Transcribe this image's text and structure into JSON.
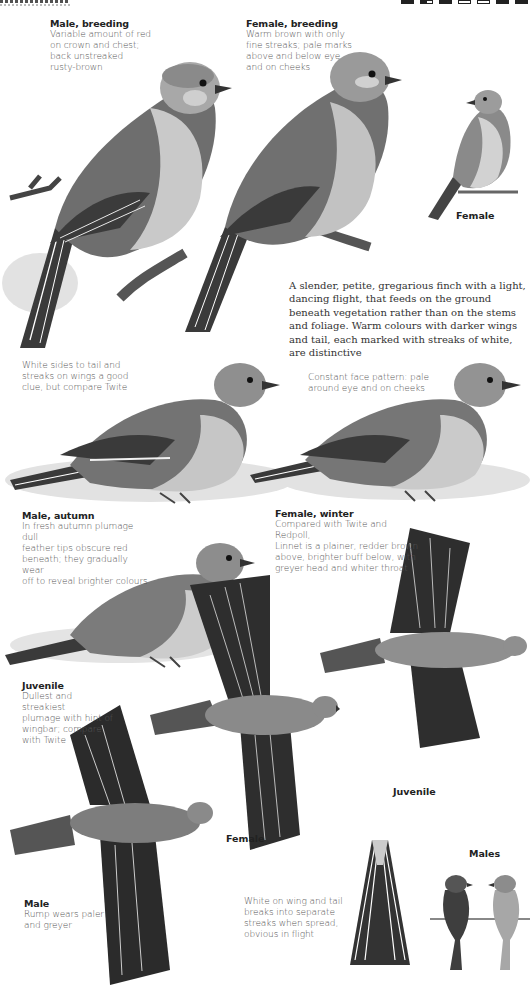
{
  "running_head": {
    "icons": [
      "habitat-icon",
      "size-icon",
      "flight-icon",
      "plumage-icon",
      "song-icon",
      "range-icon",
      "season-icon"
    ]
  },
  "captions": {
    "male_breeding": {
      "title": "Male, breeding",
      "body": "Variable amount of red\non crown and chest;\nback unstreaked\nrusty-brown"
    },
    "female_breeding": {
      "title": "Female, breeding",
      "body": "Warm brown with only\nfine streaks; pale marks\nabove and below eye\nand on cheeks"
    },
    "female_perched_label": "Female",
    "intro": "A slender, petite, gregarious finch with a light, dancing flight, that feeds on the ground beneath vegetation rather than on the stems and foliage. Warm colours with darker wings and tail, each marked with streaks of white, are distinctive",
    "white_sides": {
      "body": "White sides to tail and\nstreaks on wings a good\nclue, but compare Twite"
    },
    "face_pattern": {
      "body": "Constant face pattern: pale\naround eye and on cheeks"
    },
    "male_autumn": {
      "title": "Male,  autumn",
      "body": "In fresh autumn plumage dull\nfeather tips obscure red\nbeneath; they gradually wear\noff to reveal brighter colours"
    },
    "female_winter": {
      "title": "Female, winter",
      "body": "Compared with Twite and Redpoll,\nLinnet is a plainer, redder brown\nabove, brighter buff below, with\ngreyer head and whiter throat"
    },
    "juvenile": {
      "title": "Juvenile",
      "body": "Dullest and streakiest\nplumage with hint of\nwingbar; compare\nwith Twite"
    },
    "juvenile_flight_label": "Juvenile",
    "female_flight_label": "Female",
    "male_flight": {
      "title": "Male",
      "body": "Rump wears paler\nand greyer"
    },
    "wing_tail": {
      "body": "White on wing and tail\nbreaks into separate\nstreaks when spread,\nobvious in flight"
    },
    "males_label": "Males"
  },
  "colors": {
    "ink": "#222222",
    "caption": "#555555",
    "bird_dark": "#3a3a3a",
    "bird_mid": "#7a7a7a",
    "bird_light": "#c8c8c8",
    "paper": "#ffffff"
  }
}
